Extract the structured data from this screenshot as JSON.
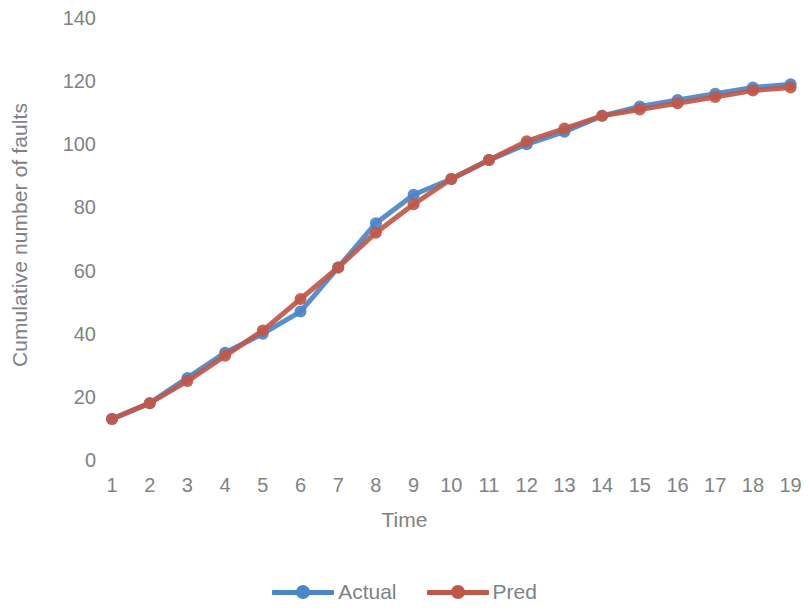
{
  "chart_data": {
    "type": "line",
    "title": "",
    "xlabel": "Time",
    "ylabel": "Cumulative number of faults",
    "x": [
      1,
      2,
      3,
      4,
      5,
      6,
      7,
      8,
      9,
      10,
      11,
      12,
      13,
      14,
      15,
      16,
      17,
      18,
      19
    ],
    "xtick_labels": [
      "1",
      "2",
      "3",
      "4",
      "5",
      "6",
      "7",
      "8",
      "9",
      "10",
      "11",
      "12",
      "13",
      "14",
      "15",
      "16",
      "17",
      "18",
      "19"
    ],
    "ytick_labels": [
      "0",
      "20",
      "40",
      "60",
      "80",
      "100",
      "120",
      "140"
    ],
    "yticks": [
      0,
      20,
      40,
      60,
      80,
      100,
      120,
      140
    ],
    "ylim": [
      0,
      140
    ],
    "xlim": [
      1,
      19
    ],
    "grid": false,
    "legend_position": "bottom",
    "series": [
      {
        "name": "Actual",
        "color": "#4A86C8",
        "marker": "circle",
        "values": [
          13,
          18,
          26,
          34,
          40,
          47,
          61,
          75,
          84,
          89,
          95,
          100,
          104,
          109,
          112,
          114,
          116,
          118,
          119
        ]
      },
      {
        "name": "Pred",
        "color": "#C0584A",
        "marker": "circle",
        "values": [
          13,
          18,
          25,
          33,
          41,
          51,
          61,
          72,
          81,
          89,
          95,
          101,
          105,
          109,
          111,
          113,
          115,
          117,
          118
        ]
      }
    ]
  },
  "axis": {
    "x_title": "Time",
    "y_title": "Cumulative number of faults"
  },
  "legend": {
    "items": [
      {
        "label": "Actual",
        "color": "#4A86C8"
      },
      {
        "label": "Pred",
        "color": "#C0584A"
      }
    ]
  },
  "colors": {
    "actual": "#4A86C8",
    "pred": "#C0584A",
    "text": "#808285",
    "background": "#ffffff"
  }
}
